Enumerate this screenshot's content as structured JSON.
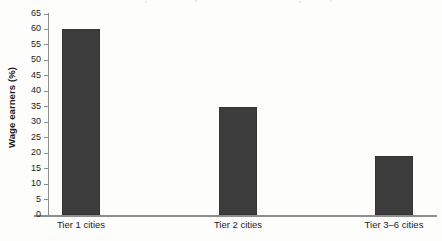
{
  "chart_data": {
    "type": "bar",
    "title": "",
    "subtitle": "",
    "xlabel": "",
    "ylabel": "Wage earners (%)",
    "categories": [
      "Tier 1 cities",
      "Tier 2 cities",
      "Tier 3–6 cities"
    ],
    "values": [
      60,
      35,
      19
    ],
    "series": [
      {
        "name": "Wage earners",
        "values": [
          60,
          35,
          19
        ]
      }
    ],
    "ylim": [
      0,
      65
    ],
    "ytick_step": 5,
    "yticks": [
      0,
      5,
      10,
      15,
      20,
      25,
      30,
      35,
      40,
      45,
      50,
      55,
      60,
      65
    ],
    "ytick_labels": [
      "0",
      "5",
      "10",
      "15",
      "20",
      "25",
      "30",
      "35",
      "40",
      "45",
      "50",
      "55",
      "60",
      "65"
    ],
    "xticks": [
      "Tier 1 cities",
      "Tier 2 cities",
      "Tier 3–6 cities"
    ],
    "grid": false,
    "legend": false,
    "legend_position": "none",
    "annotations": [],
    "bar_color": "#3c3c3c",
    "axis_color": "#8d8d8d",
    "background_color": "#fdfdfc",
    "text_color": "#1c1c1c"
  },
  "layout": {
    "plot_left_px": 48,
    "plot_top_px": 14,
    "plot_width_px": 389,
    "plot_height_px": 201,
    "bar_width_px": 38,
    "bar_centers_px": [
      81,
      238,
      394
    ]
  }
}
